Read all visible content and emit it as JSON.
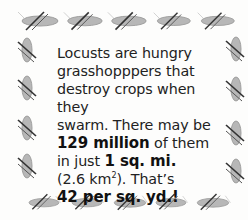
{
  "fact_box": {
    "line1": "Locusts are hungry",
    "line2": "grasshopppers that",
    "line3": "destroy crops when they",
    "line4": "swarm. There may be",
    "count": "129 million",
    "count_suffix": " of them",
    "area_prefix": "in just ",
    "area": "1 sq. mi.",
    "metric_open": "(2.6 km",
    "metric_exp": "2",
    "metric_close": "). That’s",
    "density": "42 per sq. yd.!"
  },
  "border": {
    "icon": "locust-icon",
    "top_count": 5,
    "bottom_count": 5,
    "left_count": 4,
    "right_count": 4,
    "color": "#8a8a8a"
  }
}
